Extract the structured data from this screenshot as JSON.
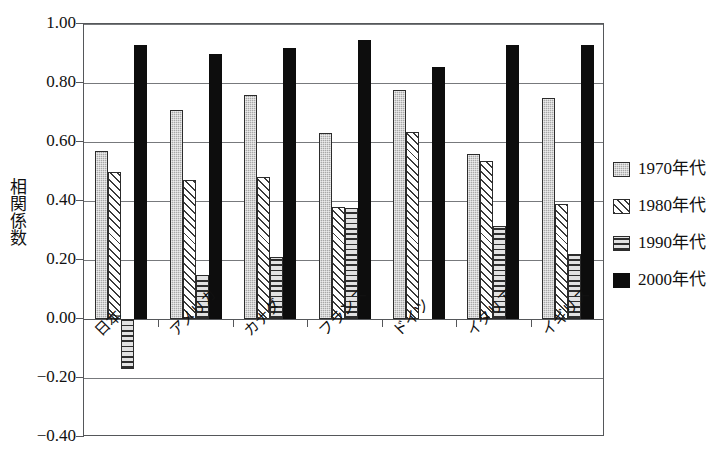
{
  "chart_data": {
    "type": "bar",
    "title": "",
    "xlabel": "",
    "ylabel": "相関係数",
    "ylim": [
      -0.4,
      1.0
    ],
    "ytick_step": 0.2,
    "ytick_labels": [
      "1.00",
      "0.80",
      "0.60",
      "0.40",
      "0.20",
      "0.00",
      "-0.20",
      "-0.40"
    ],
    "ytick_values": [
      1.0,
      0.8,
      0.6,
      0.4,
      0.2,
      0.0,
      -0.2,
      -0.4
    ],
    "grid": true,
    "legend_position": "right",
    "categories": [
      "日本",
      "アメリカ",
      "カナダ",
      "フランス",
      "ドイツ",
      "イタリア",
      "イギリス"
    ],
    "series": [
      {
        "name": "1970年代",
        "pattern": "dots",
        "color": "#a8a8a8",
        "values": [
          0.57,
          0.71,
          0.76,
          0.63,
          0.775,
          0.56,
          0.75
        ]
      },
      {
        "name": "1980年代",
        "pattern": "diagonal-hatch",
        "color": "#ffffff",
        "values": [
          0.5,
          0.47,
          0.48,
          0.38,
          0.635,
          0.535,
          0.39
        ]
      },
      {
        "name": "1990年代",
        "pattern": "horizontal-lines",
        "color": "#d9d9d9",
        "values": [
          -0.17,
          0.15,
          0.21,
          0.375,
          null,
          0.315,
          0.22
        ]
      },
      {
        "name": "2000年代",
        "pattern": "solid",
        "color": "#0d0d0d",
        "values": [
          0.93,
          0.9,
          0.92,
          0.945,
          0.855,
          0.93,
          0.93
        ]
      }
    ]
  },
  "axis": {
    "y_title": "相関係数"
  },
  "legend": {
    "items": [
      {
        "label": "1970年代",
        "pattern": "dots"
      },
      {
        "label": "1980年代",
        "pattern": "diagonal-hatch"
      },
      {
        "label": "1990年代",
        "pattern": "horizontal-lines"
      },
      {
        "label": "2000年代",
        "pattern": "solid"
      }
    ]
  }
}
